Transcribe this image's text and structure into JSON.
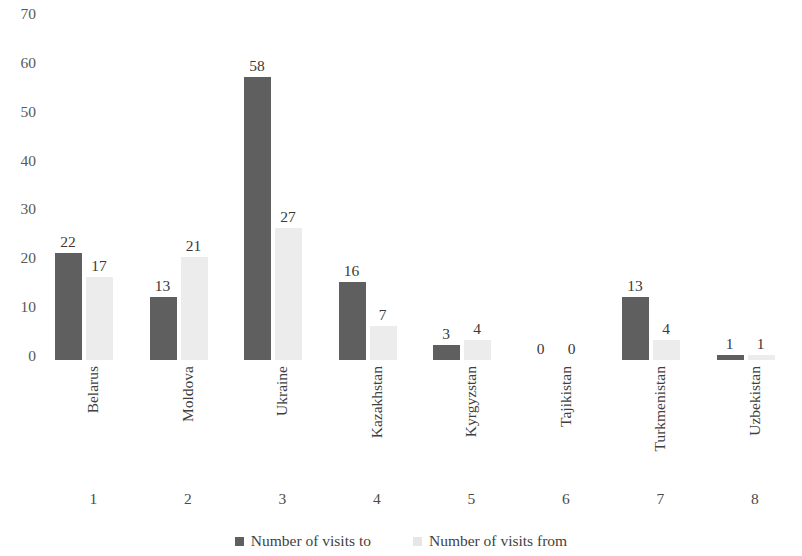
{
  "chart_data": {
    "type": "bar",
    "title": "",
    "subtitle": "",
    "xlabel": "",
    "ylabel": "",
    "ylim": [
      0,
      70
    ],
    "y_ticks": [
      70,
      60,
      50,
      40,
      30,
      20,
      10,
      0
    ],
    "grid": false,
    "legend_position": "bottom",
    "categories": [
      "Belarus",
      "Moldova",
      "Ukraine",
      "Kazakhstan",
      "Kyrgyzstan",
      "Tajikistan",
      "Turkmenistan",
      "Uzbekistan"
    ],
    "category_indices": [
      "1",
      "2",
      "3",
      "4",
      "5",
      "6",
      "7",
      "8"
    ],
    "series": [
      {
        "name": "Number of visits to",
        "color": "#5f5f5f",
        "values": [
          22,
          13,
          58,
          16,
          3,
          0,
          13,
          1
        ]
      },
      {
        "name": "Number of visits from",
        "color": "#ececec",
        "values": [
          17,
          21,
          27,
          7,
          4,
          0,
          4,
          1
        ]
      }
    ]
  },
  "legend": {
    "items": [
      {
        "label": "Number of visits to"
      },
      {
        "label": "Number of visits from"
      }
    ]
  },
  "colors": {
    "series_a": "#5f5f5f",
    "series_b": "#ececec",
    "text": "#3f3f3f",
    "background": "#ffffff"
  }
}
